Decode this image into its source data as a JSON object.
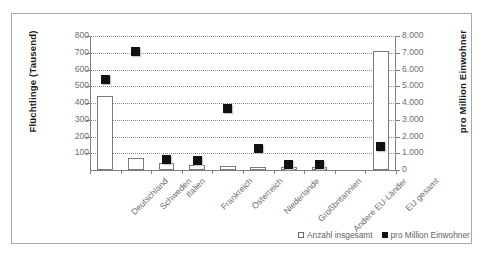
{
  "chart_data": {
    "type": "bar",
    "title": "",
    "subtitle": "",
    "categories": [
      "Deutschland",
      "Schweden",
      "Italien",
      "Frankreich",
      "Österreich",
      "Niederlande",
      "Großbritannien",
      "Andere EU-Länder",
      "",
      "EU gesamt"
    ],
    "series": [
      {
        "name": "Anzahl insgesamt",
        "axis": "left",
        "type": "bar",
        "unit": "Tausend",
        "values": [
          442,
          70,
          40,
          32,
          25,
          20,
          18,
          17,
          null,
          712
        ]
      },
      {
        "name": "pro Million Einwohner",
        "axis": "right",
        "type": "scatter",
        "unit": "pro Million Einwohner",
        "values": [
          5400,
          7100,
          650,
          560,
          3650,
          1280,
          300,
          330,
          null,
          1400
        ]
      }
    ],
    "xlabel": "",
    "ylabel": "Flüchtlinge (Tausend)",
    "ylabel_right": "pro Million Einwohner",
    "ylim": [
      0,
      800
    ],
    "ylim_right": [
      0,
      8000
    ],
    "yticks_left": [
      "100",
      "200",
      "300",
      "400",
      "500",
      "600",
      "700",
      "800"
    ],
    "yticks_right": [
      "0",
      "1.000",
      "2.000",
      "3.000",
      "4.000",
      "5.000",
      "6.000",
      "7.000",
      "8.000"
    ],
    "grid": true,
    "legend_position": "bottom-right",
    "legend": [
      {
        "label": "Anzahl insgesamt",
        "marker": "open-square"
      },
      {
        "label": "pro Million Einwohner",
        "marker": "filled-square"
      }
    ],
    "colors": {
      "bar_fill": "#ffffff",
      "bar_stroke": "#7a7a7a",
      "marker_fill": "#111111",
      "grid": "#8c8c8c",
      "axis": "#7f7f7f",
      "tick_text": "#6d6d6d",
      "frame": "#a9a9a9"
    }
  }
}
